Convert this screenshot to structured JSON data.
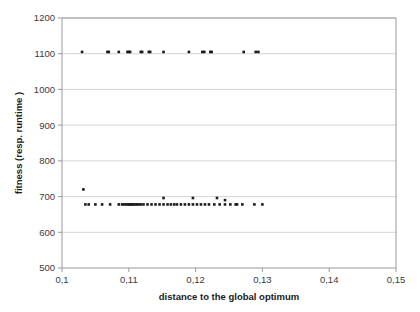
{
  "chart_data": {
    "type": "scatter",
    "title": "",
    "xlabel": "distance to the global optimum",
    "ylabel": "fitness (resp. runtime )",
    "xlim": [
      0.1,
      0.15
    ],
    "ylim": [
      500,
      1200
    ],
    "xticks": [
      0.1,
      0.11,
      0.12,
      0.13,
      0.14,
      0.15
    ],
    "xticklabels": [
      "0,1",
      "0,11",
      "0,12",
      "0,13",
      "0,14",
      "0,15"
    ],
    "yticks": [
      500,
      600,
      700,
      800,
      900,
      1000,
      1100,
      1200
    ],
    "yticklabels": [
      "500",
      "600",
      "700",
      "800",
      "900",
      "1000",
      "1100",
      "1200"
    ],
    "grid": "horizontal",
    "legend": null,
    "marker": "square",
    "marker_color": "#1b1b1b",
    "marker_size": 2.6,
    "series": [
      {
        "name": "upper-cluster",
        "points": [
          [
            0.103,
            1105
          ],
          [
            0.1068,
            1105
          ],
          [
            0.107,
            1105
          ],
          [
            0.1085,
            1105
          ],
          [
            0.1098,
            1105
          ],
          [
            0.11,
            1105
          ],
          [
            0.1102,
            1105
          ],
          [
            0.1118,
            1105
          ],
          [
            0.112,
            1105
          ],
          [
            0.113,
            1105
          ],
          [
            0.1132,
            1105
          ],
          [
            0.1152,
            1105
          ],
          [
            0.119,
            1105
          ],
          [
            0.121,
            1105
          ],
          [
            0.1213,
            1105
          ],
          [
            0.1222,
            1105
          ],
          [
            0.1224,
            1105
          ],
          [
            0.1272,
            1105
          ],
          [
            0.129,
            1105
          ],
          [
            0.1294,
            1105
          ]
        ]
      },
      {
        "name": "lower-cluster",
        "points": [
          [
            0.1032,
            720
          ],
          [
            0.1035,
            678
          ],
          [
            0.104,
            678
          ],
          [
            0.105,
            678
          ],
          [
            0.106,
            678
          ],
          [
            0.1072,
            678
          ],
          [
            0.1085,
            678
          ],
          [
            0.109,
            678
          ],
          [
            0.1093,
            678
          ],
          [
            0.1096,
            678
          ],
          [
            0.1099,
            678
          ],
          [
            0.1101,
            678
          ],
          [
            0.1103,
            678
          ],
          [
            0.1105,
            678
          ],
          [
            0.1107,
            678
          ],
          [
            0.111,
            678
          ],
          [
            0.1112,
            678
          ],
          [
            0.1115,
            678
          ],
          [
            0.1118,
            678
          ],
          [
            0.1122,
            678
          ],
          [
            0.1128,
            678
          ],
          [
            0.1134,
            678
          ],
          [
            0.114,
            678
          ],
          [
            0.1146,
            678
          ],
          [
            0.1152,
            678
          ],
          [
            0.1158,
            678
          ],
          [
            0.1163,
            678
          ],
          [
            0.1168,
            678
          ],
          [
            0.1172,
            678
          ],
          [
            0.1178,
            678
          ],
          [
            0.1184,
            678
          ],
          [
            0.119,
            678
          ],
          [
            0.1196,
            678
          ],
          [
            0.1202,
            678
          ],
          [
            0.1208,
            678
          ],
          [
            0.1214,
            678
          ],
          [
            0.122,
            678
          ],
          [
            0.1228,
            678
          ],
          [
            0.1236,
            678
          ],
          [
            0.1244,
            678
          ],
          [
            0.1252,
            678
          ],
          [
            0.126,
            678
          ],
          [
            0.127,
            678
          ],
          [
            0.1288,
            678
          ],
          [
            0.1152,
            696
          ],
          [
            0.1196,
            696
          ],
          [
            0.1232,
            696
          ],
          [
            0.1244,
            690
          ],
          [
            0.1262,
            678
          ],
          [
            0.13,
            678
          ]
        ]
      }
    ]
  }
}
